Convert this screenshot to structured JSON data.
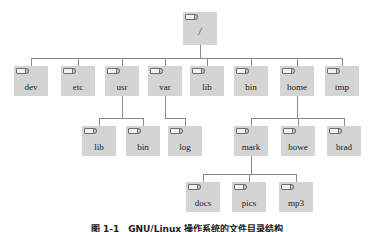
{
  "figure": {
    "type": "tree-diagram",
    "caption": "图 1-1　GNU/Linux 操作系统的文件目录结构",
    "background_color": "#ffffff",
    "node_fill_color": "#d4d4d4",
    "line_color": "#8a8a8a",
    "text_color": "#1a1a1a",
    "icon_name": "folder-icon"
  },
  "tree": {
    "root": {
      "label": "/",
      "x": 183,
      "y": 12
    },
    "level1": [
      {
        "label": "dev",
        "x": 14,
        "y": 66
      },
      {
        "label": "etc",
        "x": 61,
        "y": 66
      },
      {
        "label": "usr",
        "x": 105,
        "y": 66
      },
      {
        "label": "var",
        "x": 148,
        "y": 66
      },
      {
        "label": "lib",
        "x": 190,
        "y": 66
      },
      {
        "label": "bin",
        "x": 234,
        "y": 66
      },
      {
        "label": "home",
        "x": 280,
        "y": 66
      },
      {
        "label": "tmp",
        "x": 325,
        "y": 66
      }
    ],
    "level2": [
      {
        "label": "lib",
        "parent": "usr",
        "x": 82,
        "y": 126
      },
      {
        "label": "bin",
        "parent": "usr",
        "x": 126,
        "y": 126
      },
      {
        "label": "log",
        "parent": "var",
        "x": 168,
        "y": 126
      },
      {
        "label": "mark",
        "parent": "home",
        "x": 234,
        "y": 126
      },
      {
        "label": "bowe",
        "parent": "home",
        "x": 281,
        "y": 126
      },
      {
        "label": "brad",
        "parent": "home",
        "x": 327,
        "y": 126
      }
    ],
    "level3": [
      {
        "label": "docs",
        "parent": "mark",
        "x": 186,
        "y": 182
      },
      {
        "label": "pics",
        "parent": "mark",
        "x": 232,
        "y": 182
      },
      {
        "label": "mp3",
        "parent": "mark",
        "x": 279,
        "y": 182
      }
    ]
  }
}
